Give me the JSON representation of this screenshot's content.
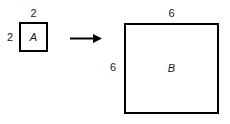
{
  "figure": {
    "type": "geometry-transformation-diagram",
    "background_color": "#ffffff",
    "stroke_color": "#000000",
    "text_color": "#1a1a1a",
    "width": 230,
    "height": 124
  },
  "shapes": {
    "small_square": {
      "name": "A",
      "label": "A",
      "side_length": 2,
      "top_dimension_label": "2",
      "left_dimension_label": "2",
      "x": 19,
      "y": 22,
      "width": 29,
      "height": 30,
      "border_width": 2
    },
    "large_square": {
      "name": "B",
      "label": "B",
      "side_length": 6,
      "top_dimension_label": "6",
      "left_dimension_label": "6",
      "x": 124,
      "y": 23,
      "width": 95,
      "height": 91,
      "border_width": 2
    }
  },
  "connector": {
    "icon": "arrow-right-icon",
    "direction": "right",
    "x": 69,
    "y": 31,
    "length": 34,
    "color": "#000000"
  }
}
